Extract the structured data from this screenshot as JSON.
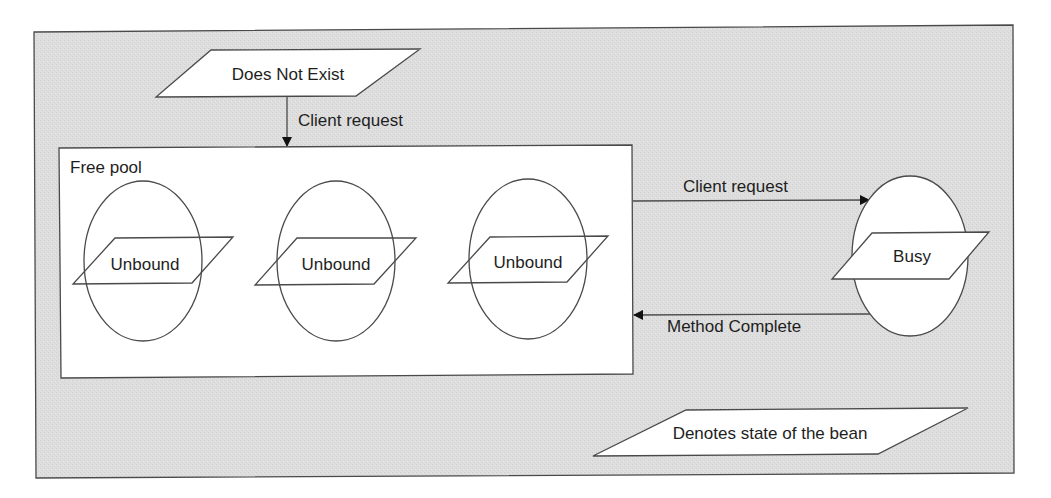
{
  "diagram": {
    "colors": {
      "background_panel": "#dcdcdc",
      "shape_fill": "#ffffff",
      "stroke": "#4a4a4a",
      "text": "#1e1e1e"
    },
    "states": {
      "does_not_exist": "Does Not Exist",
      "free_pool_label": "Free pool",
      "unbound_1": "Unbound",
      "unbound_2": "Unbound",
      "unbound_3": "Unbound",
      "busy": "Busy"
    },
    "transitions": {
      "create_request": "Client request",
      "client_request": "Client request",
      "method_complete": "Method Complete"
    },
    "legend": {
      "text": "Denotes state of the bean"
    }
  }
}
